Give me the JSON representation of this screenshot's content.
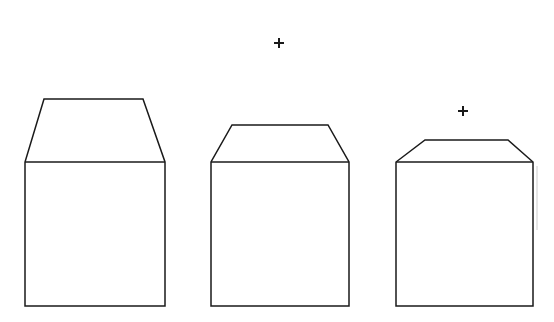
{
  "figure": {
    "width": 554,
    "height": 322,
    "background_color": "#ffffff",
    "stroke_color": "#1a1a1a",
    "stroke_width": 1.5
  },
  "shapes": [
    {
      "id": "shape-left",
      "name": "tall-steep-roof-prism",
      "label": "Shape 1",
      "body": {
        "left": 25,
        "right": 165,
        "top": 162,
        "bottom": 306,
        "width": 140,
        "height": 144
      },
      "roof": {
        "apex_left": 44,
        "apex_right": 143,
        "apex_y": 99,
        "height": 63
      },
      "points": "44,99 143,99 165,162 165,306 25,306 25,162",
      "roof_base_y": 162
    },
    {
      "id": "shape-middle",
      "name": "medium-roof-prism",
      "label": "Shape 2",
      "body": {
        "left": 211,
        "right": 349,
        "top": 162,
        "bottom": 306,
        "width": 138,
        "height": 144
      },
      "roof": {
        "apex_left": 232,
        "apex_right": 328,
        "apex_y": 125,
        "height": 37
      },
      "points": "232,125 328,125 349,162 349,306 211,306 211,162",
      "roof_base_y": 162
    },
    {
      "id": "shape-right",
      "name": "shallow-roof-prism",
      "label": "Shape 3",
      "body": {
        "left": 396,
        "right": 533,
        "top": 162,
        "bottom": 306,
        "width": 137,
        "height": 144
      },
      "roof": {
        "apex_left": 425,
        "apex_right": 508,
        "apex_y": 140,
        "height": 22
      },
      "points": "425,140 508,140 533,162 533,306 396,306 396,162",
      "roof_base_y": 162
    }
  ],
  "fixation_marks": [
    {
      "id": "cross-top",
      "name": "plus-cross-upper",
      "cx": 279,
      "cy": 43,
      "arm": 5
    },
    {
      "id": "cross-right",
      "name": "plus-cross-lower",
      "cx": 463,
      "cy": 111,
      "arm": 5
    }
  ]
}
